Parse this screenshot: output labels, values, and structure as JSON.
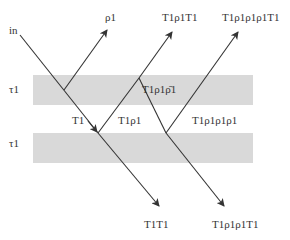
{
  "diagram": {
    "incoming_label": "in",
    "layers": [
      {
        "label": "τ1",
        "y": 75,
        "height": 30
      },
      {
        "label": "τ1",
        "y": 133,
        "height": 30
      }
    ],
    "layer_color": "#d9d9d9",
    "line_color": "#333333",
    "top_outputs": [
      {
        "label": "ρ1"
      },
      {
        "label": "T1ρ1T1"
      },
      {
        "label": "T1ρ1ρ1ρ1T1"
      }
    ],
    "bottom_outputs": [
      {
        "label": "T1T1"
      },
      {
        "label": "T1ρ1ρ1T1"
      }
    ],
    "inner_labels": [
      {
        "label": "T1ρ1ρ̄1"
      },
      {
        "label": "T1"
      },
      {
        "label": "T1ρ1"
      },
      {
        "label": "T1ρ1ρ1ρ1"
      }
    ]
  }
}
